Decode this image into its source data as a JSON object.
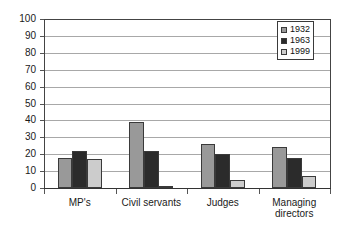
{
  "chart_data": {
    "type": "bar",
    "title": "",
    "xlabel": "",
    "ylabel": "",
    "ylim": [
      0,
      100
    ],
    "ytick_step": 10,
    "yticks": [
      "0",
      "10",
      "20",
      "30",
      "40",
      "50",
      "60",
      "70",
      "80",
      "90",
      "100"
    ],
    "grid": true,
    "legend_position": "top-right",
    "categories": [
      "MP's",
      "Civil servants",
      "Judges",
      "Managing\ndirectors"
    ],
    "series": [
      {
        "name": "1932",
        "color": "#999999",
        "values": [
          18,
          39,
          26,
          24
        ]
      },
      {
        "name": "1963",
        "color": "#2b2b2b",
        "values": [
          22,
          22,
          20,
          18
        ]
      },
      {
        "name": "1999",
        "color": "#cccccc",
        "values": [
          17,
          1,
          5,
          7
        ]
      }
    ]
  },
  "legend": {
    "entries": [
      {
        "label": "1932",
        "swatch_color": "#999999"
      },
      {
        "label": "1963",
        "swatch_color": "#2b2b2b"
      },
      {
        "label": "1999",
        "swatch_color": "#cccccc"
      }
    ]
  }
}
